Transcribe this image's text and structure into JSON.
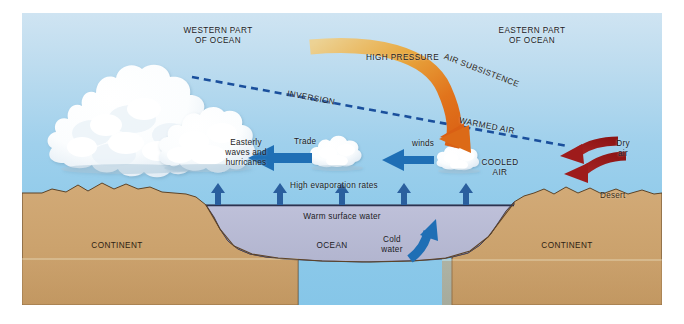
{
  "diagram": {
    "title_western": "WESTERN PART\nOF OCEAN",
    "title_eastern": "EASTERN PART\nOF OCEAN",
    "high_pressure": "HIGH PRESSURE",
    "air_subsistence": "AIR SUBSISTENCE",
    "inversion": "INVERSION",
    "warmed_air": "WARMED AIR",
    "easterly": "Easterly\nwaves and\nhurricanes",
    "trade": "Trade",
    "winds": "winds",
    "cooled_air": "COOLED\nAIR",
    "dry_air": "Dry\nair",
    "desert": "Desert",
    "high_evaporation": "High evaporation rates",
    "warm_surface_water": "Warm surface water",
    "ocean": "OCEAN",
    "cold_water": "Cold\nwater",
    "continent_left": "CONTINENT",
    "continent_right": "CONTINENT"
  },
  "colors": {
    "sky_top": "#cfe4f2",
    "sky_bottom": "#86c6e8",
    "land": "#cfa672",
    "land_shadow": "#c39a66",
    "ocean_water": "#b9bcd6",
    "arrow_blue": "#1f6fb5",
    "arrow_darkred": "#9e1b1b",
    "arrow_orange": "#e2771f",
    "arrow_tan": "#e8d08a",
    "dashed_blue": "#1a4f9c",
    "text": "#1b1b24",
    "frame_white": "#ffffff"
  }
}
